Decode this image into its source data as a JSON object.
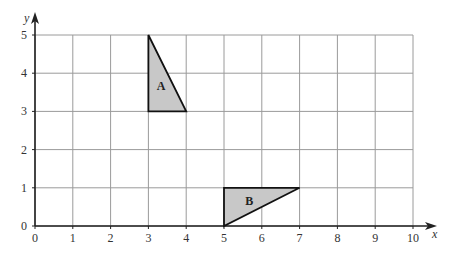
{
  "axes": {
    "x_label": "x",
    "y_label": "y",
    "x_ticks": [
      "0",
      "1",
      "2",
      "3",
      "4",
      "5",
      "6",
      "7",
      "8",
      "9",
      "10"
    ],
    "y_ticks": [
      "0",
      "1",
      "2",
      "3",
      "4",
      "5"
    ],
    "xlim": [
      0,
      10
    ],
    "ylim": [
      0,
      5
    ]
  },
  "shapes": [
    {
      "label": "A",
      "vertices": [
        [
          3,
          5
        ],
        [
          3,
          3
        ],
        [
          4,
          3
        ]
      ],
      "fill": "#c8c8c8"
    },
    {
      "label": "B",
      "vertices": [
        [
          5,
          1
        ],
        [
          5,
          0
        ],
        [
          7,
          1
        ]
      ],
      "fill": "#c8c8c8"
    }
  ],
  "colors": {
    "grid": "#9a9a9a",
    "axis": "#222222",
    "shape_fill": "#c8c8c8",
    "shape_stroke": "#111111"
  }
}
